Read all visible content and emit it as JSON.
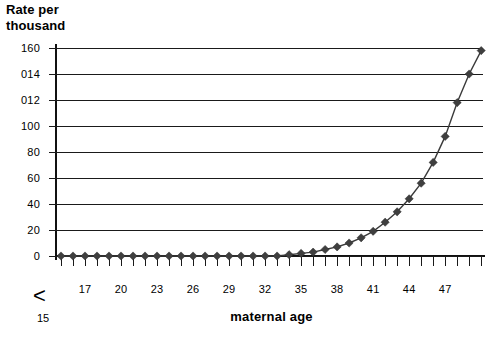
{
  "chart_data": {
    "type": "line",
    "title_lines": [
      "Rate per",
      "thousand"
    ],
    "xlabel": "maternal age",
    "ylabel": "Rate per thousand",
    "grid": "horizontal",
    "legend": "none",
    "xlim_categories": 36,
    "ylim": [
      0,
      160
    ],
    "ytick_values": [
      0,
      20,
      40,
      60,
      80,
      100,
      120,
      140,
      160
    ],
    "ytick_labels": [
      "0",
      "20",
      "40",
      "60",
      "80",
      "100",
      "012",
      "014",
      "160"
    ],
    "first_category_label": "15",
    "first_category_prefix": "<",
    "xtick_labels": [
      "17",
      "20",
      "23",
      "26",
      "29",
      "32",
      "35",
      "38",
      "41",
      "44",
      "47"
    ],
    "xtick_label_indices": [
      2,
      5,
      8,
      11,
      14,
      17,
      20,
      23,
      26,
      29,
      32
    ],
    "categories": [
      "<15",
      "16",
      "17",
      "18",
      "19",
      "20",
      "21",
      "22",
      "23",
      "24",
      "25",
      "26",
      "27",
      "28",
      "29",
      "30",
      "31",
      "32",
      "33",
      "34",
      "35",
      "36",
      "37",
      "38",
      "39",
      "40",
      "41",
      "42",
      "43",
      "44",
      "45",
      "46",
      "47",
      "48",
      "49",
      "50"
    ],
    "values": [
      0,
      0,
      0,
      0,
      0,
      0,
      0,
      0,
      0,
      0,
      0,
      0,
      0,
      0,
      0,
      0,
      0,
      0,
      0,
      1,
      2,
      3,
      5,
      7,
      10,
      14,
      19,
      26,
      34,
      44,
      56,
      72,
      92,
      118,
      140,
      158
    ],
    "marker": "diamond",
    "series": [
      {
        "name": "Rate per thousand",
        "values": [
          0,
          0,
          0,
          0,
          0,
          0,
          0,
          0,
          0,
          0,
          0,
          0,
          0,
          0,
          0,
          0,
          0,
          0,
          0,
          1,
          2,
          3,
          5,
          7,
          10,
          14,
          19,
          26,
          34,
          44,
          56,
          72,
          92,
          118,
          140,
          158
        ]
      }
    ],
    "colors": {
      "line": "#3a3a3a",
      "marker": "#3f3f3f",
      "grid": "#1a1a1a",
      "axis": "#111111",
      "background": "#ffffff"
    }
  }
}
